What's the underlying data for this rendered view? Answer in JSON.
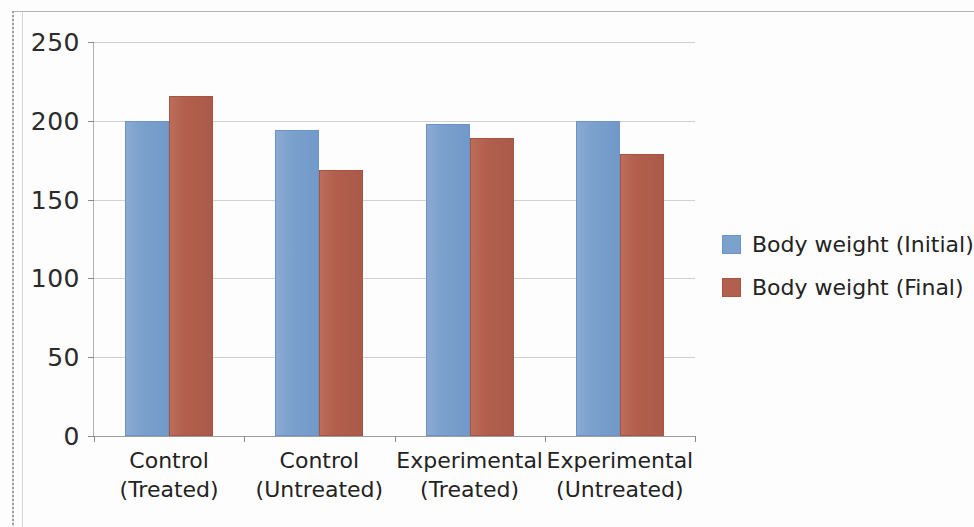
{
  "chart_data": {
    "type": "bar",
    "title": "",
    "xlabel": "",
    "ylabel": "",
    "ylim": [
      0,
      250
    ],
    "yticks": [
      0,
      50,
      100,
      150,
      200,
      250
    ],
    "ytick_labels": [
      "0",
      "50",
      "100",
      "150",
      "200",
      "250"
    ],
    "grid": true,
    "legend_position": "right",
    "categories": [
      "Control\n(Treated)",
      "Control\n(Untreated)",
      "Experimental\n(Treated)",
      "Experimental\n(Untreated)"
    ],
    "category_lines": [
      [
        "Control",
        "(Treated)"
      ],
      [
        "Control",
        "(Untreated)"
      ],
      [
        "Experimental",
        "(Treated)"
      ],
      [
        "Experimental",
        "(Untreated)"
      ]
    ],
    "series": [
      {
        "name": "Body weight (Initial)",
        "color": "#7ba1cd",
        "values": [
          200,
          194,
          198,
          200
        ]
      },
      {
        "name": "Body weight (Final)",
        "color": "#b25f4d",
        "values": [
          216,
          169,
          189,
          179
        ]
      }
    ]
  },
  "legend": {
    "items": [
      {
        "label": "Body weight (Initial)",
        "swatch": "#7ba1cd"
      },
      {
        "label": "Body weight (Final)",
        "swatch": "#b25f4d"
      }
    ]
  },
  "colors": {
    "series_initial": "#7ba1cd",
    "series_final": "#b25f4d",
    "gridline": "#c9c9c9",
    "axis": "#8a8a8a",
    "text": "#232323",
    "background": "#ffffff"
  }
}
